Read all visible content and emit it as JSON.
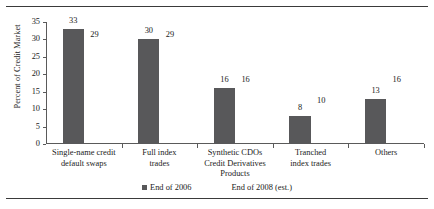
{
  "chart_data": {
    "type": "bar",
    "title": "",
    "xlabel": "",
    "ylabel": "Percent of Credit Market",
    "ylim": [
      0,
      35
    ],
    "yticks": [
      "0",
      "5",
      "10",
      "15",
      "20",
      "25",
      "30",
      "35"
    ],
    "grid": false,
    "legend_position": "bottom",
    "categories": [
      "Single-name credit default swaps",
      "Full index trades",
      "Synthetic CDOs Credit Derivatives Products",
      "Tranched index trades",
      "Others"
    ],
    "category_lines": [
      [
        "Single-name credit",
        "default swaps"
      ],
      [
        "Full index",
        "trades"
      ],
      [
        "Synthetic CDOs",
        "Credit Derivatives",
        "Products"
      ],
      [
        "Tranched",
        "index trades"
      ],
      [
        "Others"
      ]
    ],
    "series": [
      {
        "name": "End of 2006",
        "color": "#58585a",
        "visible_bars": true,
        "values": [
          33,
          30,
          16,
          8,
          13
        ]
      },
      {
        "name": "End of 2008 (est.)",
        "color": "#ffffff",
        "visible_bars": false,
        "values": [
          29,
          29,
          16,
          10,
          16
        ]
      }
    ]
  },
  "legend": {
    "entries": [
      {
        "label": "End of 2006"
      },
      {
        "label": "End of 2008 (est.)"
      }
    ]
  },
  "axis": {
    "y_title": "Percent of Credit Market"
  }
}
